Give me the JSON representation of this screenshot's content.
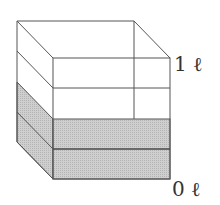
{
  "diagram": {
    "type": "cube-container-volume",
    "labels": {
      "top": "1 ℓ",
      "bottom": "0 ℓ"
    },
    "layers_total": 4,
    "layers_filled": 2,
    "colors": {
      "line": "#555555",
      "fill": "#c8c8c8",
      "background": "#ffffff"
    }
  }
}
